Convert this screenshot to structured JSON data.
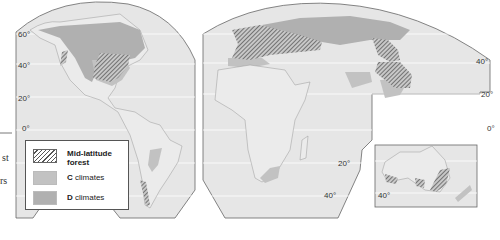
{
  "map": {
    "latitude_labels_left": [
      "60°",
      "40°",
      "20°",
      "0°"
    ],
    "latitude_labels_africa": [
      "20°",
      "40°"
    ],
    "latitude_labels_right": [
      "40°",
      "20°",
      "0°"
    ],
    "australia_label": "40°",
    "colors": {
      "ocean": "#e6e6e6",
      "land": "#e9e9e9",
      "c_climate": "#c2c2c2",
      "d_climate": "#b0b0b0",
      "hatch": "#555555",
      "border": "#666666"
    }
  },
  "legend": {
    "items": [
      {
        "label_line1": "Mid-latitude",
        "label_line2": "forest",
        "type": "hatched"
      },
      {
        "label_bold": "C",
        "label_rest": " climates",
        "type": "c"
      },
      {
        "label_bold": "D",
        "label_rest": " climates",
        "type": "d"
      }
    ]
  },
  "side_text": {
    "fragment1": "st",
    "fragment2": "rs"
  }
}
